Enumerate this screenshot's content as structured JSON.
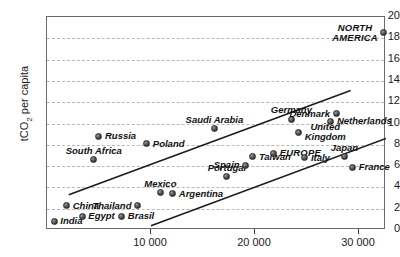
{
  "chart_data": {
    "type": "scatter",
    "title": "",
    "xlabel": "",
    "ylabel": "tCO2 per capita",
    "ylabel_rich": "tCO₂ per capita",
    "xlim": [
      0,
      32600
    ],
    "ylim": [
      0,
      20
    ],
    "grid": true,
    "legend": "none",
    "y_ticks": [
      0,
      2,
      4,
      6,
      8,
      10,
      12,
      14,
      16,
      18,
      20
    ],
    "y_tick_labels": [
      "0",
      "2",
      "4",
      "6",
      "8",
      "10",
      "12",
      "14",
      "16",
      "18",
      "20"
    ],
    "x_ticks": [
      10000,
      20000,
      30000
    ],
    "x_tick_labels": [
      "10 000",
      "20 000",
      "30 000"
    ],
    "points": [
      {
        "label": "India",
        "x": 700,
        "y": 0.8,
        "anchor": "right",
        "lines": [
          "India"
        ]
      },
      {
        "label": "China",
        "x": 1900,
        "y": 2.3,
        "anchor": "right",
        "lines": [
          "China"
        ]
      },
      {
        "label": "Egypt",
        "x": 3400,
        "y": 1.3,
        "anchor": "right",
        "lines": [
          "Egypt"
        ]
      },
      {
        "label": "South Africa",
        "x": 4500,
        "y": 6.6,
        "anchor": "center-above",
        "lines": [
          "South Africa"
        ]
      },
      {
        "label": "Russia",
        "x": 5000,
        "y": 8.8,
        "anchor": "right",
        "lines": [
          "Russia"
        ]
      },
      {
        "label": "Brasil",
        "x": 7200,
        "y": 1.3,
        "anchor": "right",
        "lines": [
          "Brasil"
        ]
      },
      {
        "label": "Thailand",
        "x": 8700,
        "y": 2.3,
        "anchor": "left",
        "lines": [
          "Thailand"
        ]
      },
      {
        "label": "Poland",
        "x": 9600,
        "y": 8.1,
        "anchor": "right",
        "lines": [
          "Poland"
        ]
      },
      {
        "label": "Mexico",
        "x": 10900,
        "y": 3.5,
        "anchor": "center-above",
        "lines": [
          "Mexico"
        ]
      },
      {
        "label": "Argentina",
        "x": 12100,
        "y": 3.4,
        "anchor": "right",
        "lines": [
          "Argentina"
        ]
      },
      {
        "label": "Saudi Arabia",
        "x": 16100,
        "y": 9.5,
        "anchor": "center-above",
        "lines": [
          "Saudi Arabia"
        ]
      },
      {
        "label": "Portugal",
        "x": 17300,
        "y": 5.0,
        "anchor": "center-above",
        "lines": [
          "Portugal"
        ]
      },
      {
        "label": "Spain",
        "x": 19100,
        "y": 6.1,
        "anchor": "left",
        "lines": [
          "Spain"
        ]
      },
      {
        "label": "Taiwan",
        "x": 19800,
        "y": 6.9,
        "anchor": "right",
        "lines": [
          "Taiwan"
        ]
      },
      {
        "label": "EUROPE",
        "x": 21800,
        "y": 7.2,
        "anchor": "right",
        "lines": [
          "EUROPE"
        ],
        "caps": true
      },
      {
        "label": "Germany",
        "x": 23500,
        "y": 10.4,
        "anchor": "center-above",
        "lines": [
          "Germany"
        ]
      },
      {
        "label": "United Kingdom",
        "x": 24200,
        "y": 9.2,
        "anchor": "right",
        "lines": [
          "United",
          "Kingdom"
        ]
      },
      {
        "label": "Italy",
        "x": 24800,
        "y": 6.8,
        "anchor": "right",
        "lines": [
          "Italy"
        ]
      },
      {
        "label": "Denmark",
        "x": 27800,
        "y": 10.9,
        "anchor": "left",
        "lines": [
          "Denmark"
        ]
      },
      {
        "label": "Netherlands",
        "x": 27300,
        "y": 10.2,
        "anchor": "right",
        "lines": [
          "Netherlands"
        ]
      },
      {
        "label": "Japan",
        "x": 28600,
        "y": 6.9,
        "anchor": "center-above",
        "lines": [
          "Japan"
        ]
      },
      {
        "label": "France",
        "x": 29400,
        "y": 5.9,
        "anchor": "right",
        "lines": [
          "France"
        ]
      },
      {
        "label": "NORTH AMERICA",
        "x": 32400,
        "y": 18.5,
        "anchor": "left",
        "lines": [
          "NORTH",
          "AMERICA"
        ],
        "caps": true
      }
    ],
    "trend_lines": [
      {
        "name": "upper-envelope",
        "x1": 2100,
        "y1": 3.3,
        "x2": 29200,
        "y2": 13.1
      },
      {
        "name": "lower-envelope",
        "x1": 10000,
        "y1": 0.4,
        "x2": 32600,
        "y2": 8.6
      }
    ]
  }
}
